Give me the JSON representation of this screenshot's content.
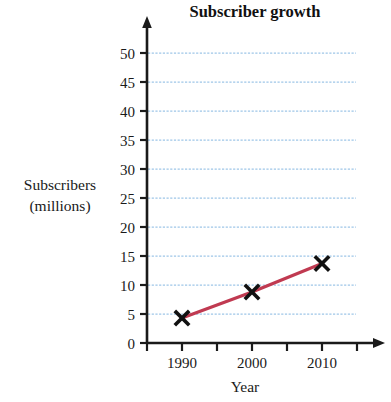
{
  "chart_data": {
    "type": "line",
    "title": "Subscriber growth",
    "xlabel": "Year",
    "ylabel": "Subscribers (millions)",
    "ylabel_line1": "Subscribers",
    "ylabel_line2": "(millions)",
    "x": [
      1990,
      2000,
      2010
    ],
    "values": [
      4.3,
      8.8,
      13.7
    ],
    "series": [
      {
        "name": "Subscribers",
        "x": [
          1990,
          2000,
          2010
        ],
        "values": [
          4.3,
          8.8,
          13.7
        ]
      }
    ],
    "xtick_labels": [
      "1990",
      "2000",
      "2010"
    ],
    "ytick_labels": [
      "0",
      "5",
      "10",
      "15",
      "20",
      "25",
      "30",
      "35",
      "40",
      "45",
      "50"
    ],
    "ytick_values": [
      0,
      5,
      10,
      15,
      20,
      25,
      30,
      35,
      40,
      45,
      50
    ],
    "ylim": [
      0,
      50
    ],
    "xlim": [
      1985,
      2020
    ],
    "grid": true,
    "grid_axis": "y",
    "legend": "none",
    "marker": "x-cross",
    "line_color": "#c03a51",
    "grid_color": "#9ec6e8",
    "axis_color": "#1a1a1a",
    "marker_color": "#111111",
    "background_color": "#ffffff"
  }
}
